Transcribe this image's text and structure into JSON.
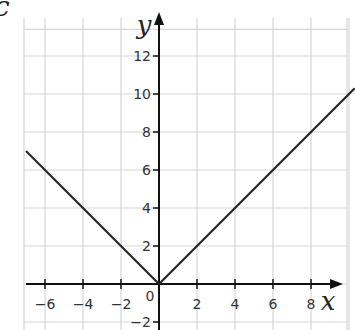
{
  "part_label": "c",
  "chart_data": {
    "type": "line",
    "title": "",
    "function": "y = |x|",
    "xlabel": "x",
    "ylabel": "y",
    "xlim": [
      -7,
      10.3
    ],
    "ylim": [
      -2.5,
      13.2
    ],
    "x_ticks": [
      -6,
      -4,
      -2,
      2,
      4,
      6,
      8
    ],
    "y_ticks": [
      -2,
      2,
      4,
      6,
      8,
      10,
      12
    ],
    "origin_label": "0",
    "grid": true,
    "grid_spacing": 2,
    "series": [
      {
        "name": "y = |x|",
        "color": "#222222",
        "points": [
          {
            "x": -7,
            "y": 7
          },
          {
            "x": 0,
            "y": 0
          },
          {
            "x": 10.3,
            "y": 10.3
          }
        ]
      }
    ],
    "colors": {
      "grid": "#d6d6d6",
      "axis": "#111111",
      "line": "#222222"
    }
  }
}
